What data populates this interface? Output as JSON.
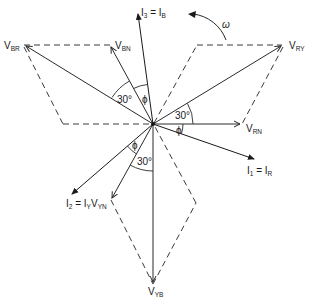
{
  "diagram": {
    "colors": {
      "line": "#2a2a2a",
      "dash": "#3a3a3a",
      "text": "#1a1a1a",
      "background": "#ffffff"
    },
    "rotation_label": "ω",
    "labels": {
      "v_ry": {
        "main": "V",
        "sub": "RY"
      },
      "v_rn": {
        "main": "V",
        "sub": "RN"
      },
      "v_br": {
        "main": "V",
        "sub": "BR"
      },
      "v_bn": {
        "main": "V",
        "sub": "BN"
      },
      "v_yb": {
        "main": "V",
        "sub": "YB"
      },
      "v_yn": {
        "main": "V",
        "sub": "YN"
      },
      "i3": {
        "text": "I3 = IB",
        "a": "I",
        "a_sub": "3",
        "eq": " = ",
        "b": "I",
        "b_sub": "B"
      },
      "i1": {
        "text": "I1 = IR",
        "a": "I",
        "a_sub": "1",
        "eq": " = ",
        "b": "I",
        "b_sub": "R"
      },
      "i2": {
        "text": "I2 = IY",
        "a": "I",
        "a_sub": "2",
        "eq": " = ",
        "b": "I",
        "b_sub": "Y"
      }
    },
    "angles": {
      "thirty_right": "30°",
      "phi_right": "ϕ",
      "thirty_top": "30°",
      "phi_top": "ϕ",
      "thirty_bottom": "30°",
      "phi_bottom": "ϕ"
    }
  }
}
